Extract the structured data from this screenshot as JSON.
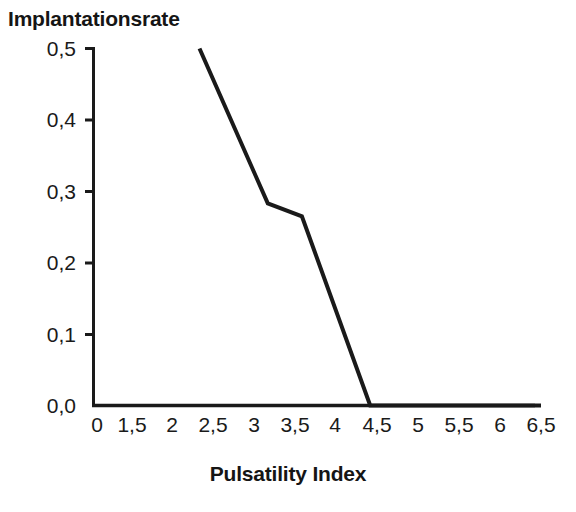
{
  "title": "Implantationsrate",
  "axes": {
    "x_title": "Pulsatility Index",
    "y_title": "",
    "x_ticklabels": [
      "0",
      "1,5",
      "2",
      "2,5",
      "3",
      "3,5",
      "4",
      "4,5",
      "5",
      "5,5",
      "6",
      "6,5"
    ],
    "y_ticklabels": [
      "0,5",
      "0,4",
      "0,3",
      "0,2",
      "0,1",
      "0,0"
    ]
  },
  "style": {
    "line_color": "#1a1a1a",
    "axis_color": "#1a1a1a",
    "background": "#ffffff",
    "line_width_px": 4
  },
  "chart_data": {
    "type": "line",
    "title": "Implantationsrate",
    "xlabel": "Pulsatility Index",
    "ylabel": "Implantationsrate",
    "xlim": [
      0,
      6.5
    ],
    "ylim": [
      0.0,
      0.5
    ],
    "grid": false,
    "legend": false,
    "x_ticks": [
      0,
      1.5,
      2,
      2.5,
      3,
      3.5,
      4,
      4.5,
      5,
      5.5,
      6,
      6.5
    ],
    "x_tick_labels": [
      "0",
      "1,5",
      "2",
      "2,5",
      "3",
      "3,5",
      "4",
      "4,5",
      "5",
      "5,5",
      "6",
      "6,5"
    ],
    "y_ticks": [
      0.0,
      0.1,
      0.2,
      0.3,
      0.4,
      0.5
    ],
    "y_tick_labels": [
      "0,0",
      "0,1",
      "0,2",
      "0,3",
      "0,4",
      "0,5"
    ],
    "series": [
      {
        "name": "Implantationsrate",
        "x": [
          1.5,
          2.5,
          3.0,
          4.0,
          6.5
        ],
        "values": [
          0.5,
          0.283,
          0.265,
          0.0,
          0.0
        ]
      }
    ]
  }
}
